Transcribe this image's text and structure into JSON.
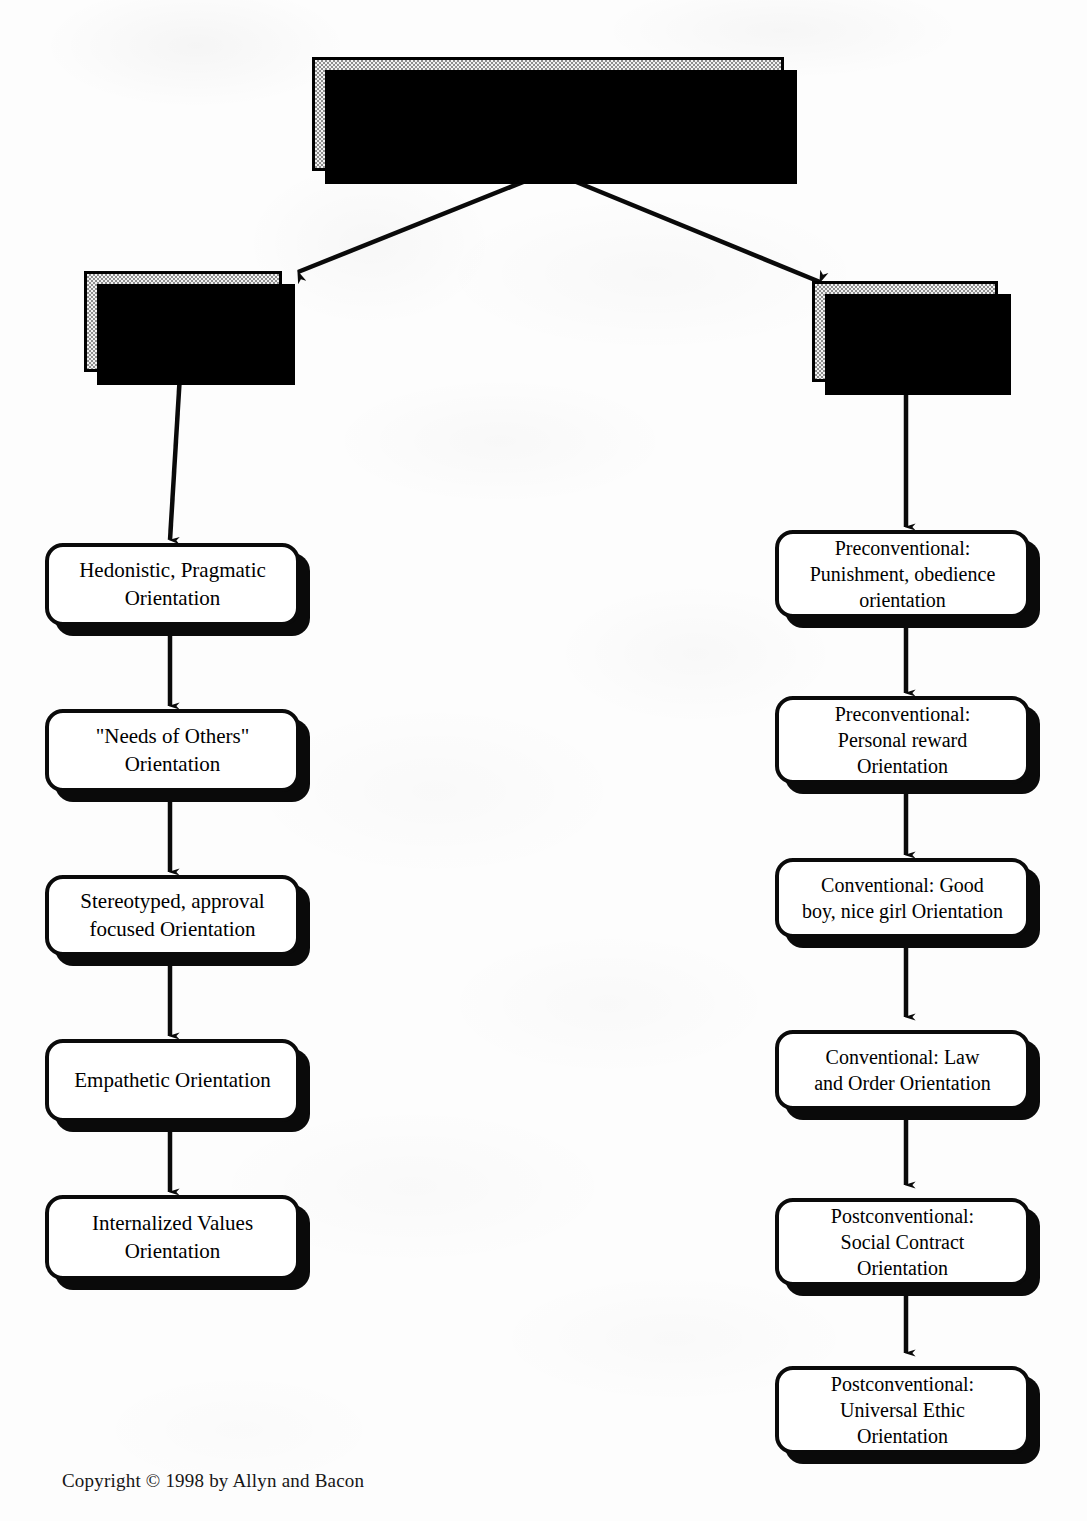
{
  "document": {
    "type": "flowchart",
    "title": "Moral Reasoning",
    "copyright": "Copyright © 1998 by Allyn and Bacon"
  },
  "root": {
    "label": "Moral Reasoning"
  },
  "branches": [
    {
      "id": "eisenberg",
      "label": "Eisenberg"
    },
    {
      "id": "kohlberg",
      "label": "Kohlberg"
    }
  ],
  "eisenberg_stages": [
    {
      "index": 1,
      "label": "Hedonistic, Pragmatic\nOrientation"
    },
    {
      "index": 2,
      "label": "\"Needs of Others\"\nOrientation"
    },
    {
      "index": 3,
      "label": "Stereotyped, approval\nfocused  Orientation"
    },
    {
      "index": 4,
      "label": "Empathetic Orientation"
    },
    {
      "index": 5,
      "label": "Internalized Values\nOrientation"
    }
  ],
  "kohlberg_stages": [
    {
      "index": 1,
      "label": "Preconventional:\nPunishment, obedience\norientation"
    },
    {
      "index": 2,
      "label": "Preconventional:\nPersonal reward\nOrientation"
    },
    {
      "index": 3,
      "label": "Conventional:  Good\nboy, nice girl Orientation"
    },
    {
      "index": 4,
      "label": "Conventional:  Law\nand Order Orientation"
    },
    {
      "index": 5,
      "label": "Postconventional:\nSocial Contract\nOrientation"
    },
    {
      "index": 6,
      "label": "Postconventional:\nUniversal Ethic\nOrientation"
    }
  ],
  "colors": {
    "ink": "#000000",
    "page": "#fdfdfd",
    "stipple_light": "#f2f2f2",
    "stipple_dark": "#8e8e8e",
    "box_fill": "#ffffff"
  }
}
